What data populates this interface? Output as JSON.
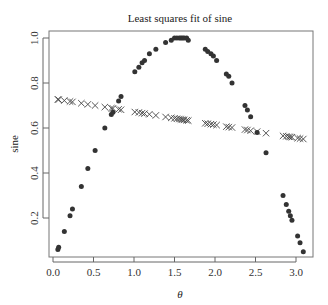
{
  "chart_data": {
    "type": "scatter",
    "title": "Least squares fit of sine",
    "xlabel": "θ",
    "ylabel": "sine",
    "xlim": [
      0.0,
      3.2
    ],
    "ylim": [
      0.04,
      1.03
    ],
    "xticks": [
      0.0,
      0.5,
      1.0,
      1.5,
      2.0,
      2.5,
      3.0
    ],
    "xtick_labels": [
      "0.0",
      "0.5",
      "1.0",
      "1.5",
      "2.0",
      "2.5",
      "3.0"
    ],
    "yticks": [
      0.2,
      0.4,
      0.6,
      0.8,
      1.0
    ],
    "ytick_labels": [
      "0.2",
      "0.4",
      "0.6",
      "0.8",
      "1.0"
    ],
    "grid": false,
    "legend": null,
    "series": [
      {
        "name": "sine",
        "marker": "circle",
        "color": "#333333",
        "x": [
          0.06,
          0.07,
          0.14,
          0.21,
          0.24,
          0.35,
          0.43,
          0.52,
          0.64,
          0.72,
          0.74,
          0.81,
          0.84,
          1.01,
          1.06,
          1.1,
          1.13,
          1.19,
          1.27,
          1.39,
          1.46,
          1.5,
          1.53,
          1.56,
          1.58,
          1.6,
          1.62,
          1.65,
          1.67,
          1.88,
          1.91,
          1.95,
          1.98,
          2.02,
          2.14,
          2.17,
          2.21,
          2.37,
          2.4,
          2.44,
          2.52,
          2.63,
          2.84,
          2.88,
          2.91,
          2.93,
          2.95,
          3.02,
          3.05,
          3.09
        ],
        "y": [
          0.06,
          0.07,
          0.14,
          0.21,
          0.24,
          0.34,
          0.42,
          0.5,
          0.6,
          0.66,
          0.67,
          0.72,
          0.74,
          0.85,
          0.87,
          0.89,
          0.9,
          0.93,
          0.95,
          0.98,
          0.99,
          1.0,
          1.0,
          1.0,
          1.0,
          1.0,
          1.0,
          1.0,
          0.99,
          0.95,
          0.94,
          0.93,
          0.92,
          0.9,
          0.84,
          0.83,
          0.8,
          0.7,
          0.68,
          0.65,
          0.58,
          0.49,
          0.3,
          0.26,
          0.23,
          0.21,
          0.19,
          0.12,
          0.09,
          0.05
        ]
      },
      {
        "name": "least squares fit",
        "marker": "cross",
        "color": "#444444",
        "x": [
          0.06,
          0.07,
          0.14,
          0.21,
          0.24,
          0.35,
          0.43,
          0.52,
          0.64,
          0.72,
          0.74,
          0.81,
          0.84,
          1.01,
          1.06,
          1.1,
          1.13,
          1.19,
          1.27,
          1.39,
          1.46,
          1.5,
          1.53,
          1.56,
          1.58,
          1.6,
          1.62,
          1.65,
          1.67,
          1.88,
          1.91,
          1.95,
          1.98,
          2.02,
          2.14,
          2.17,
          2.21,
          2.37,
          2.4,
          2.44,
          2.52,
          2.63,
          2.84,
          2.88,
          2.91,
          2.93,
          2.95,
          3.02,
          3.05,
          3.09
        ],
        "y": [
          0.727,
          0.726,
          0.722,
          0.718,
          0.716,
          0.71,
          0.705,
          0.7,
          0.693,
          0.688,
          0.687,
          0.683,
          0.681,
          0.671,
          0.669,
          0.666,
          0.664,
          0.661,
          0.656,
          0.649,
          0.645,
          0.643,
          0.641,
          0.64,
          0.638,
          0.637,
          0.636,
          0.634,
          0.633,
          0.621,
          0.619,
          0.617,
          0.615,
          0.613,
          0.606,
          0.604,
          0.602,
          0.593,
          0.591,
          0.588,
          0.584,
          0.577,
          0.565,
          0.563,
          0.561,
          0.56,
          0.559,
          0.555,
          0.553,
          0.551
        ]
      }
    ]
  }
}
